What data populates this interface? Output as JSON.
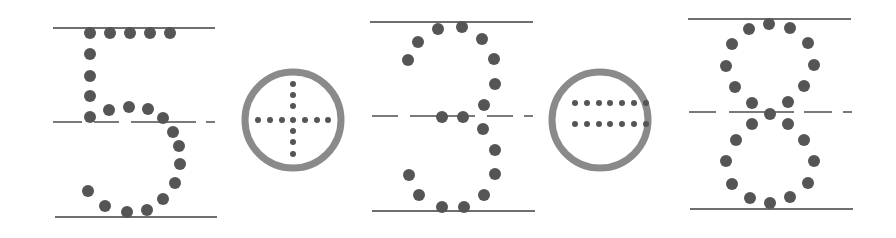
{
  "worksheet": {
    "equation": "5 + 3 = 8",
    "colors": {
      "dot": "#555555",
      "line": "#6e6e6e",
      "dash": "#7a7a7a",
      "ring": "#8a8a8a",
      "background": "#ffffff"
    },
    "glyphs": [
      {
        "name": "digit-5",
        "value": "5",
        "top_line": {
          "x1": 53,
          "x2": 215,
          "y": 28
        },
        "bottom_line": {
          "x1": 55,
          "x2": 217,
          "y": 217
        },
        "dashes": [
          [
            53,
            82,
            122
          ],
          [
            94,
            119,
            122
          ],
          [
            131,
            196,
            122
          ],
          [
            206,
            215,
            122
          ]
        ],
        "dot_r": 6,
        "dots": [
          [
            90,
            33
          ],
          [
            110,
            33
          ],
          [
            130,
            33
          ],
          [
            150,
            33
          ],
          [
            170,
            33
          ],
          [
            90,
            54
          ],
          [
            90,
            76
          ],
          [
            90,
            96
          ],
          [
            90,
            117
          ],
          [
            109,
            110
          ],
          [
            129,
            107
          ],
          [
            148,
            109
          ],
          [
            163,
            118
          ],
          [
            173,
            132
          ],
          [
            179,
            146
          ],
          [
            180,
            164
          ],
          [
            175,
            183
          ],
          [
            163,
            199
          ],
          [
            147,
            210
          ],
          [
            127,
            212
          ],
          [
            105,
            206
          ],
          [
            88,
            191
          ]
        ]
      },
      {
        "name": "plus-sign",
        "value": "+",
        "ring": {
          "cx": 293,
          "cy": 120,
          "r": 48,
          "stroke": 7
        },
        "dot_r": 3,
        "dots": [
          [
            293,
            84
          ],
          [
            293,
            95
          ],
          [
            293,
            106
          ],
          [
            258,
            120
          ],
          [
            270,
            120
          ],
          [
            282,
            120
          ],
          [
            293,
            120
          ],
          [
            305,
            120
          ],
          [
            317,
            120
          ],
          [
            328,
            120
          ],
          [
            293,
            131
          ],
          [
            293,
            142
          ],
          [
            293,
            154
          ]
        ]
      },
      {
        "name": "digit-3",
        "value": "3",
        "top_line": {
          "x1": 370,
          "x2": 533,
          "y": 22
        },
        "bottom_line": {
          "x1": 372,
          "x2": 535,
          "y": 211
        },
        "dashes": [
          [
            372,
            398,
            116
          ],
          [
            410,
            475,
            116
          ],
          [
            487,
            513,
            116
          ],
          [
            524,
            533,
            116
          ]
        ],
        "dot_r": 6,
        "dots": [
          [
            438,
            29
          ],
          [
            462,
            27
          ],
          [
            482,
            39
          ],
          [
            494,
            59
          ],
          [
            495,
            84
          ],
          [
            484,
            105
          ],
          [
            442,
            117
          ],
          [
            463,
            117
          ],
          [
            483,
            129
          ],
          [
            495,
            150
          ],
          [
            495,
            174
          ],
          [
            484,
            195
          ],
          [
            442,
            207
          ],
          [
            464,
            207
          ],
          [
            419,
            195
          ],
          [
            409,
            175
          ],
          [
            418,
            42
          ],
          [
            408,
            60
          ]
        ]
      },
      {
        "name": "equals-sign",
        "value": "=",
        "ring": {
          "cx": 600,
          "cy": 120,
          "r": 48,
          "stroke": 7
        },
        "dot_r": 3,
        "dots": [
          [
            575,
            103
          ],
          [
            587,
            103
          ],
          [
            599,
            103
          ],
          [
            610,
            103
          ],
          [
            622,
            103
          ],
          [
            634,
            103
          ],
          [
            646,
            103
          ],
          [
            575,
            124
          ],
          [
            587,
            124
          ],
          [
            599,
            124
          ],
          [
            610,
            124
          ],
          [
            622,
            124
          ],
          [
            634,
            124
          ],
          [
            646,
            124
          ]
        ]
      },
      {
        "name": "digit-8",
        "value": "8",
        "top_line": {
          "x1": 688,
          "x2": 851,
          "y": 19
        },
        "bottom_line": {
          "x1": 690,
          "x2": 853,
          "y": 209
        },
        "dashes": [
          [
            689,
            716,
            112
          ],
          [
            729,
            794,
            112
          ],
          [
            804,
            832,
            112
          ],
          [
            843,
            852,
            112
          ]
        ],
        "dot_r": 6,
        "dots": [
          [
            769,
            24
          ],
          [
            749,
            29
          ],
          [
            790,
            28
          ],
          [
            732,
            44
          ],
          [
            808,
            43
          ],
          [
            726,
            66
          ],
          [
            814,
            65
          ],
          [
            735,
            87
          ],
          [
            804,
            86
          ],
          [
            752,
            103
          ],
          [
            788,
            102
          ],
          [
            770,
            114
          ],
          [
            752,
            124
          ],
          [
            788,
            124
          ],
          [
            736,
            140
          ],
          [
            804,
            140
          ],
          [
            726,
            161
          ],
          [
            814,
            161
          ],
          [
            732,
            184
          ],
          [
            808,
            183
          ],
          [
            750,
            198
          ],
          [
            790,
            197
          ],
          [
            770,
            203
          ]
        ]
      }
    ]
  }
}
